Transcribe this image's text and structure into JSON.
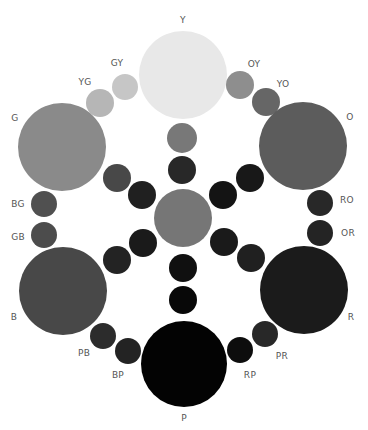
{
  "hues": [
    {
      "id": "Y",
      "label": "Y",
      "cx": 183,
      "cy": 75,
      "r": 44,
      "color": "#e8e8e8",
      "lx": 183,
      "ly": 20
    },
    {
      "id": "GY",
      "label": "GY",
      "cx": 125,
      "cy": 87,
      "r": 13,
      "color": "#c6c6c6",
      "lx": 117,
      "ly": 63
    },
    {
      "id": "YG",
      "label": "YG",
      "cx": 100,
      "cy": 103,
      "r": 14,
      "color": "#b6b6b6",
      "lx": 85,
      "ly": 82
    },
    {
      "id": "OY",
      "label": "OY",
      "cx": 240,
      "cy": 85,
      "r": 14,
      "color": "#8e8e8e",
      "lx": 254,
      "ly": 64
    },
    {
      "id": "YO",
      "label": "YO",
      "cx": 266,
      "cy": 102,
      "r": 14,
      "color": "#666666",
      "lx": 283,
      "ly": 84
    },
    {
      "id": "G",
      "label": "G",
      "cx": 62,
      "cy": 147,
      "r": 44,
      "color": "#8a8a8a",
      "lx": 15,
      "ly": 118
    },
    {
      "id": "O",
      "label": "O",
      "cx": 303,
      "cy": 146,
      "r": 44,
      "color": "#5c5c5c",
      "lx": 350,
      "ly": 117
    },
    {
      "id": "BG",
      "label": "BG",
      "cx": 44,
      "cy": 204,
      "r": 13,
      "color": "#505050",
      "lx": 18,
      "ly": 204
    },
    {
      "id": "GB",
      "label": "GB",
      "cx": 44,
      "cy": 235,
      "r": 13,
      "color": "#4c4c4c",
      "lx": 18,
      "ly": 237
    },
    {
      "id": "RO",
      "label": "RO",
      "cx": 320,
      "cy": 203,
      "r": 13,
      "color": "#282828",
      "lx": 347,
      "ly": 200
    },
    {
      "id": "OR",
      "label": "OR",
      "cx": 320,
      "cy": 233,
      "r": 13,
      "color": "#242424",
      "lx": 348,
      "ly": 233
    },
    {
      "id": "B",
      "label": "B",
      "cx": 63,
      "cy": 291,
      "r": 44,
      "color": "#484848",
      "lx": 14,
      "ly": 317
    },
    {
      "id": "R",
      "label": "R",
      "cx": 304,
      "cy": 290,
      "r": 44,
      "color": "#1b1b1b",
      "lx": 351,
      "ly": 317
    },
    {
      "id": "PB",
      "label": "PB",
      "cx": 103,
      "cy": 336,
      "r": 13,
      "color": "#2c2c2c",
      "lx": 84,
      "ly": 353
    },
    {
      "id": "BP",
      "label": "BP",
      "cx": 128,
      "cy": 351,
      "r": 13,
      "color": "#232323",
      "lx": 118,
      "ly": 375
    },
    {
      "id": "PR",
      "label": "PR",
      "cx": 265,
      "cy": 334,
      "r": 13,
      "color": "#282828",
      "lx": 282,
      "ly": 356
    },
    {
      "id": "RP",
      "label": "RP",
      "cx": 240,
      "cy": 350,
      "r": 13,
      "color": "#0d0d0d",
      "lx": 250,
      "ly": 375
    },
    {
      "id": "P",
      "label": "P",
      "cx": 184,
      "cy": 364,
      "r": 43,
      "color": "#030303",
      "lx": 184,
      "ly": 418
    }
  ],
  "center": {
    "cx": 183,
    "cy": 218,
    "r": 29,
    "color": "#767676"
  },
  "spokes": [
    {
      "id": "top-outer",
      "cx": 182,
      "cy": 138,
      "r": 15,
      "color": "#787878"
    },
    {
      "id": "top-inner",
      "cx": 182,
      "cy": 170,
      "r": 14,
      "color": "#282828"
    },
    {
      "id": "ul-outer",
      "cx": 117,
      "cy": 178,
      "r": 14,
      "color": "#484848"
    },
    {
      "id": "ul-inner",
      "cx": 142,
      "cy": 195,
      "r": 14,
      "color": "#202020"
    },
    {
      "id": "ur-outer",
      "cx": 250,
      "cy": 178,
      "r": 14,
      "color": "#181818"
    },
    {
      "id": "ur-inner",
      "cx": 223,
      "cy": 195,
      "r": 14,
      "color": "#141414"
    },
    {
      "id": "ll-inner",
      "cx": 143,
      "cy": 243,
      "r": 14,
      "color": "#1a1a1a"
    },
    {
      "id": "ll-outer",
      "cx": 117,
      "cy": 260,
      "r": 14,
      "color": "#232323"
    },
    {
      "id": "lr-inner",
      "cx": 224,
      "cy": 242,
      "r": 14,
      "color": "#1a1a1a"
    },
    {
      "id": "lr-outer",
      "cx": 251,
      "cy": 258,
      "r": 14,
      "color": "#202020"
    },
    {
      "id": "bottom-inner",
      "cx": 183,
      "cy": 268,
      "r": 14,
      "color": "#101010"
    },
    {
      "id": "bottom-outer",
      "cx": 183,
      "cy": 300,
      "r": 14,
      "color": "#080808"
    }
  ]
}
